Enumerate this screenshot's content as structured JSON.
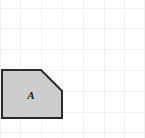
{
  "canvas": {
    "width": 145,
    "height": 138,
    "background_color": "#ffffff"
  },
  "grid": {
    "visible": true,
    "line_color": "#f0f0f0",
    "line_width": 1,
    "spacing": 20.8,
    "vertical_lines_x": [
      0,
      20.8,
      41.6,
      62.4,
      83.2,
      104,
      124.8,
      144
    ],
    "horizontal_lines_y": [
      8,
      28.8,
      49.6,
      70.4,
      91.2,
      112,
      132.8
    ]
  },
  "shape": {
    "name": "pentagon-with-cut-corner",
    "label": "A",
    "fill_color": "#cdcdcd",
    "stroke_color": "#2b2b2b",
    "stroke_width": 2,
    "points": "2,70 41,70 62,91 62,118 2,118",
    "vertices": [
      {
        "x": 2,
        "y": 70
      },
      {
        "x": 41,
        "y": 70
      },
      {
        "x": 62,
        "y": 91
      },
      {
        "x": 62,
        "y": 118
      },
      {
        "x": 2,
        "y": 118
      }
    ],
    "label_position": {
      "x": 31,
      "y": 99
    }
  }
}
